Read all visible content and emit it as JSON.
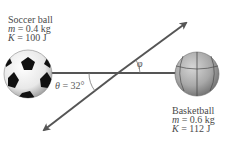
{
  "soccer_ball": {
    "title": "Soccer ball",
    "mass_symbol": "m",
    "mass_value": " = 0.4 kg",
    "energy_symbol": "K",
    "energy_value": " = 100 J"
  },
  "basketball": {
    "title": "Basketball",
    "mass_symbol": "m",
    "mass_value": " = 0.6 kg",
    "energy_symbol": "K",
    "energy_value": " = 112 J"
  },
  "angles": {
    "theta_symbol": "θ",
    "theta_value": " = 32°",
    "phi_symbol": "φ"
  },
  "colors": {
    "line": "#555555",
    "arrow": "#555555",
    "text": "#4a4a4a"
  }
}
